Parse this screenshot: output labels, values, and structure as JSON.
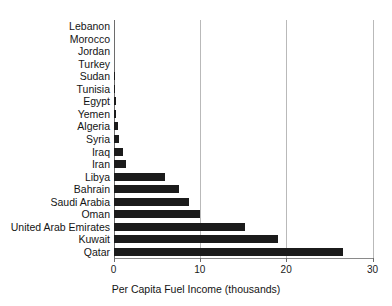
{
  "chart_data": {
    "type": "bar",
    "orientation": "horizontal",
    "title": "",
    "xlabel": "Per Capita Fuel Income (thousands)",
    "ylabel": "",
    "xlim": [
      0,
      30
    ],
    "xticks": [
      0,
      10,
      20,
      30
    ],
    "xtick_labels": [
      "0",
      "10",
      "20",
      "30"
    ],
    "grid": "vertical",
    "legend": "none",
    "bar_color": "#1b1b1b",
    "categories": [
      "Lebanon",
      "Morocco",
      "Jordan",
      "Turkey",
      "Sudan",
      "Tunisia",
      "Egypt",
      "Yemen",
      "Algeria",
      "Syria",
      "Iraq",
      "Iran",
      "Libya",
      "Bahrain",
      "Saudi Arabia",
      "Oman",
      "United Arab Emirates",
      "Kuwait",
      "Qatar"
    ],
    "values": [
      0.0,
      0.0,
      0.0,
      0.02,
      0.06,
      0.15,
      0.25,
      0.3,
      0.5,
      0.6,
      1.1,
      1.4,
      6.0,
      7.6,
      8.7,
      10.0,
      15.2,
      19.0,
      26.6
    ]
  }
}
